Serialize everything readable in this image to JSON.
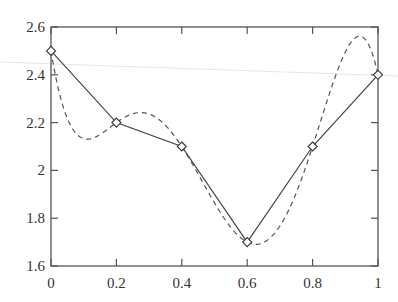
{
  "chart_data": {
    "type": "line",
    "title": "",
    "xlabel": "",
    "ylabel": "",
    "xlim": [
      0,
      1
    ],
    "ylim": [
      1.6,
      2.6
    ],
    "grid": false,
    "legend": null,
    "x_ticks": [
      0,
      0.2,
      0.4,
      0.6,
      0.8,
      1
    ],
    "x_tick_labels": [
      "0",
      "0.2",
      "0.4",
      "0.6",
      "0.8",
      "1"
    ],
    "y_ticks": [
      1.6,
      1.8,
      2.0,
      2.2,
      2.4,
      2.6
    ],
    "y_tick_labels": [
      "1.6",
      "1.8",
      "2",
      "2.2",
      "2.4",
      "2.6"
    ],
    "series": [
      {
        "name": "data-points",
        "style": "solid",
        "marker": "diamond",
        "x": [
          0,
          0.2,
          0.4,
          0.6,
          0.8,
          1
        ],
        "y": [
          2.5,
          2.2,
          2.1,
          1.7,
          2.1,
          2.4
        ]
      },
      {
        "name": "interpolating-polynomial",
        "style": "dashed",
        "marker": "none",
        "description": "Degree-5 polynomial interpolating the data points",
        "interpolates": "data-points"
      }
    ]
  }
}
